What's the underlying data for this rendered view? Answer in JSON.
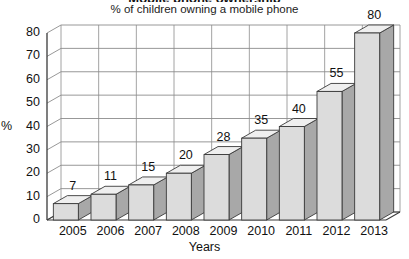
{
  "title_clipped": "Mobile phone ownership",
  "subtitle": "% of children owning a mobile phone",
  "axis": {
    "y_unit": "%",
    "x_title": "Years"
  },
  "colors": {
    "bar_front": "#dcdcdc",
    "bar_side": "#a8a8a8",
    "bar_top": "#efefef",
    "outline": "#3a3a3a",
    "grid": "#8c8c8c",
    "text": "#111111",
    "background": "#ffffff"
  },
  "chart_data": {
    "type": "bar",
    "title": "% of children owning a mobile phone",
    "xlabel": "Years",
    "ylabel": "%",
    "categories": [
      "2005",
      "2006",
      "2007",
      "2008",
      "2009",
      "2010",
      "2011",
      "2012",
      "2013"
    ],
    "values": [
      7,
      11,
      15,
      20,
      28,
      35,
      40,
      55,
      80
    ],
    "yticks": [
      0,
      10,
      20,
      30,
      40,
      50,
      60,
      70,
      80
    ],
    "ylim": [
      0,
      80
    ],
    "grid": true,
    "legend": false,
    "style": "3d-bar",
    "data_labels": [
      "7",
      "11",
      "15",
      "20",
      "28",
      "35",
      "40",
      "55",
      "80"
    ],
    "ytick_labels": [
      "0",
      "10",
      "20",
      "30",
      "40",
      "50",
      "60",
      "70",
      "80"
    ]
  }
}
